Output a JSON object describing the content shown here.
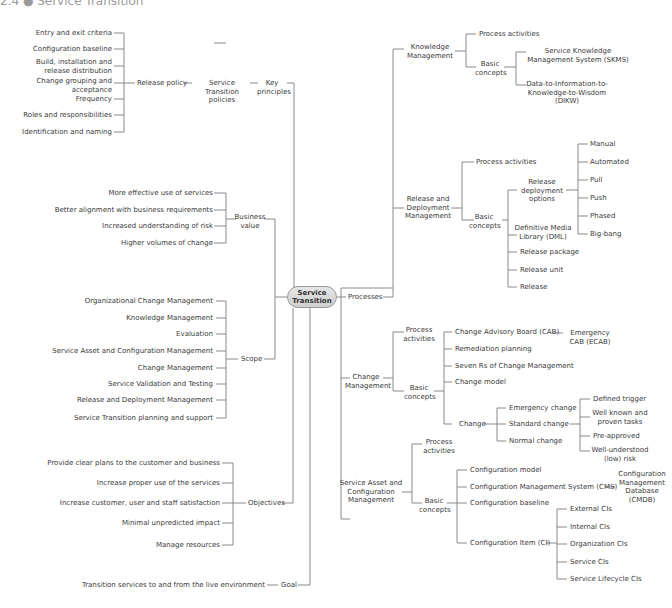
{
  "header": {
    "title": "2.4 ● Service Transition"
  },
  "root": {
    "label_line1": "Service",
    "label_line2": "Transition"
  },
  "key_principles": {
    "label": "Key principles",
    "policies": "Service Transition policies",
    "release_policy": "Release policy",
    "items": [
      "Entry and exit criteria",
      "Configuration baseline",
      "Build, installation and release distribution",
      "Change grouping and acceptance",
      "Frequency",
      "Roles and responsibilities",
      "Identification and naming"
    ]
  },
  "business_value": {
    "label": "Business value",
    "items": [
      "More effective use of services",
      "Better alignment with business requirements",
      "Increased understanding of risk",
      "Higher volumes of change"
    ]
  },
  "scope": {
    "label": "Scope",
    "items": [
      "Organizational Change Management",
      "Knowledge Management",
      "Evaluation",
      "Service Asset and Configuration Management",
      "Change Management",
      "Service Validation and Testing",
      "Release and Deployment Management",
      "Service Transition planning and support"
    ]
  },
  "objectives": {
    "label": "Objectives",
    "items": [
      "Provide clear plans to the customer and business",
      "Increase proper use of the services",
      "Increase customer, user and staff satisfaction",
      "Minimal unpredicted impact",
      "Manage resources"
    ]
  },
  "goal": {
    "label": "Goal",
    "item": "Transition services to and from the live environment"
  },
  "processes": {
    "label": "Processes",
    "knowledge": {
      "label": "Knowledge Management",
      "process_activities": "Process activities",
      "basic_concepts": "Basic concepts",
      "concepts": [
        "Service Knowledge Management System (SKMS)",
        "Data-to-Information-to-Knowledge-to-Wisdom (DIKW)"
      ]
    },
    "release": {
      "label": "Release and Deployment Management",
      "process_activities": "Process activities",
      "basic_concepts": "Basic concepts",
      "deployment_options_label": "Release deployment options",
      "deployment_options": [
        "Manual",
        "Automated",
        "Pull",
        "Push",
        "Phased",
        "Big-bang"
      ],
      "concepts": [
        "Definitive Media Library (DML)",
        "Release package",
        "Release unit",
        "Release"
      ]
    },
    "change": {
      "label": "Change Management",
      "process_activities": "Process activities",
      "basic_concepts": "Basic concepts",
      "cab": "Change Advisory Board (CAB)",
      "ecab": "Emergency CAB (ECAB)",
      "concepts": [
        "Remediation planning",
        "Seven Rs of Change Management",
        "Change model"
      ],
      "change_label": "Change",
      "change_types": [
        "Emergency change",
        "Standard change",
        "Normal change"
      ],
      "standard_attributes": [
        "Defined trigger",
        "Well known and proven tasks",
        "Pre-approved",
        "Well-understood (low) risk"
      ]
    },
    "sacm": {
      "label": "Service Asset and Configuration Management",
      "process_activities": "Process activities",
      "basic_concepts": "Basic concepts",
      "concepts": [
        "Configuration model",
        "Configuration Management System (CMS)",
        "Configuration baseline",
        "Configuration Item (CI)"
      ],
      "cmdb": "Configuration Management Database (CMDB)",
      "ci_types": [
        "External CIs",
        "Internal CIs",
        "Organization CIs",
        "Service CIs",
        "Service Lifecycle CIs"
      ]
    }
  }
}
